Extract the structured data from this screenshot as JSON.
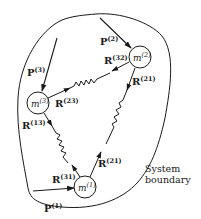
{
  "diagram": {
    "masses": [
      {
        "id": "m1",
        "symbol": "m",
        "superscript": "(1)"
      },
      {
        "id": "m2",
        "symbol": "m",
        "superscript": "(2)"
      },
      {
        "id": "m3",
        "symbol": "m",
        "superscript": "(3)"
      }
    ],
    "external_forces": [
      {
        "id": "P1",
        "symbol": "P",
        "superscript": "(1)",
        "acts_on": "m1"
      },
      {
        "id": "P2",
        "symbol": "P",
        "superscript": "(2)",
        "acts_on": "m2"
      },
      {
        "id": "P3",
        "symbol": "P",
        "superscript": "(3)",
        "acts_on": "m3"
      }
    ],
    "internal_forces": [
      {
        "id": "R32",
        "symbol": "R",
        "superscript": "(32)",
        "acts_on": "m2"
      },
      {
        "id": "R23",
        "symbol": "R",
        "superscript": "(23)",
        "acts_on": "m3"
      },
      {
        "id": "R21",
        "symbol": "R",
        "superscript": "(21)",
        "acts_on": "m2"
      },
      {
        "id": "R12",
        "symbol": "R",
        "superscript": "(21)",
        "acts_on": "m1"
      },
      {
        "id": "R13",
        "symbol": "R",
        "superscript": "(13)",
        "acts_on": "m3"
      },
      {
        "id": "R31",
        "symbol": "R",
        "superscript": "(31)",
        "acts_on": "m1"
      }
    ],
    "boundary_label_line1": "System",
    "boundary_label_line2": "boundary",
    "colors": {
      "stroke": "#1a1a1a",
      "background": "#ffffff"
    }
  }
}
